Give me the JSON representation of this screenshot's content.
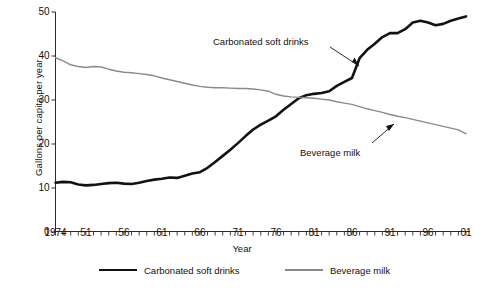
{
  "chart_data": {
    "type": "line",
    "title": "",
    "xlabel": "Year",
    "ylabel": "Gallons per capita per year",
    "xlim": [
      1947,
      2001
    ],
    "ylim": [
      0,
      50
    ],
    "grid": false,
    "legend_position": "bottom",
    "y_ticks": [
      0,
      10,
      20,
      30,
      40,
      50
    ],
    "y_tick_labels": [
      "0",
      "10",
      "20",
      "30",
      "40",
      "50"
    ],
    "x_ticks": [
      1947,
      1951,
      1956,
      1961,
      1966,
      1971,
      1976,
      1981,
      1986,
      1991,
      1996,
      2001
    ],
    "x_tick_labels": [
      "1974",
      "51",
      "56",
      "61",
      "66",
      "71",
      "76",
      "81",
      "86",
      "91",
      "96",
      "01"
    ],
    "x_minor_tick_interval": 1,
    "annotations": [
      {
        "text": "Carbonated soft drinks",
        "points_to_series": "Carbonated soft drinks",
        "points_to_year": 1984,
        "points_to_value": 39
      },
      {
        "text": "Beverage milk",
        "points_to_series": "Beverage milk",
        "points_to_year": 1990,
        "points_to_value": 25.5
      }
    ],
    "x": [
      1947,
      1948,
      1949,
      1950,
      1951,
      1952,
      1953,
      1954,
      1955,
      1956,
      1957,
      1958,
      1959,
      1960,
      1961,
      1962,
      1963,
      1964,
      1965,
      1966,
      1967,
      1968,
      1969,
      1970,
      1971,
      1972,
      1973,
      1974,
      1975,
      1976,
      1977,
      1978,
      1979,
      1980,
      1981,
      1982,
      1983,
      1984,
      1985,
      1986,
      1987,
      1988,
      1989,
      1990,
      1991,
      1992,
      1993,
      1994,
      1995,
      1996,
      1997,
      1998,
      1999,
      2000,
      2001
    ],
    "series": [
      {
        "name": "Carbonated soft drinks",
        "color": "#121212",
        "line_width": 2.6,
        "values": [
          11.2,
          11.4,
          11.3,
          10.8,
          10.6,
          10.7,
          10.9,
          11.1,
          11.2,
          11.0,
          10.9,
          11.2,
          11.6,
          11.9,
          12.1,
          12.4,
          12.3,
          12.8,
          13.3,
          13.6,
          14.6,
          15.9,
          17.3,
          18.7,
          20.2,
          21.8,
          23.3,
          24.4,
          25.3,
          26.3,
          27.8,
          29.1,
          30.4,
          31.1,
          31.4,
          31.6,
          32.0,
          33.2,
          34.1,
          35.0,
          39.5,
          41.4,
          42.8,
          44.3,
          45.2,
          45.2,
          46.1,
          47.6,
          48.0,
          47.6,
          47.0,
          47.3,
          48.0,
          48.5,
          49.0
        ]
      },
      {
        "name": "Beverage milk",
        "color": "#8a8a8a",
        "line_width": 1.4,
        "values": [
          39.6,
          38.9,
          38.0,
          37.6,
          37.4,
          37.6,
          37.5,
          37.0,
          36.6,
          36.3,
          36.2,
          36.0,
          35.8,
          35.5,
          35.0,
          34.6,
          34.2,
          33.8,
          33.4,
          33.1,
          32.9,
          32.8,
          32.8,
          32.7,
          32.6,
          32.6,
          32.5,
          32.3,
          32.0,
          31.3,
          30.9,
          30.7,
          30.6,
          30.5,
          30.4,
          30.2,
          30.0,
          29.6,
          29.3,
          29.0,
          28.5,
          28.0,
          27.6,
          27.2,
          26.7,
          26.3,
          26.0,
          25.6,
          25.2,
          24.8,
          24.4,
          24.0,
          23.6,
          23.2,
          22.3
        ]
      }
    ]
  },
  "legend": [
    {
      "label": "Carbonated soft drinks",
      "style": "thick"
    },
    {
      "label": "Beverage milk",
      "style": "thin"
    }
  ],
  "axes": {
    "y_title": "Gallons per capita per year",
    "x_title": "Year"
  }
}
